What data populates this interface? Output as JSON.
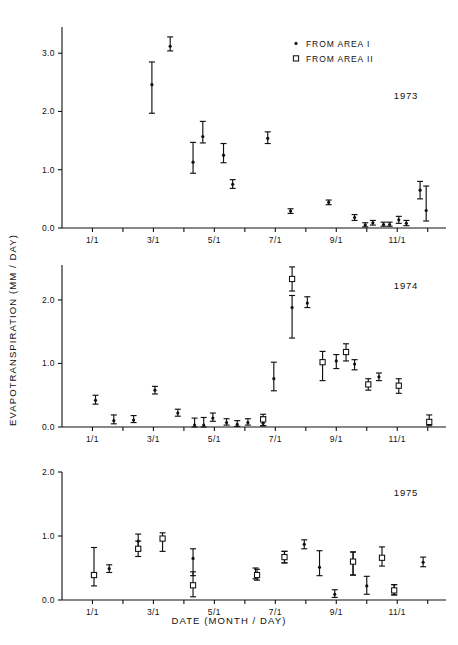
{
  "figure": {
    "xlabel": "DATE  (MONTH / DAY)",
    "ylabel": "EVAPOTRANSPIRATION  (MM / DAY)"
  },
  "legend": {
    "position": "top-right",
    "entries": [
      {
        "label": "FROM AREA I",
        "marker": "filled-dot"
      },
      {
        "label": "FROM AREA II",
        "marker": "open-square"
      }
    ]
  },
  "chart_data": [
    {
      "type": "scatter",
      "title": "1973",
      "xlabel": "DATE  (MONTH / DAY)",
      "ylabel": "EVAPOTRANSPIRATION  (MM / DAY)",
      "xlim": [
        0,
        12.6
      ],
      "ylim": [
        0.0,
        3.45
      ],
      "yticks": [
        0.0,
        1.0,
        2.0,
        3.0
      ],
      "ytick_labels": [
        "0.0",
        "1.0",
        "2.0",
        "3.0"
      ],
      "xticks": [
        1,
        2,
        3,
        4,
        5,
        6,
        7,
        8,
        9,
        10,
        11,
        12
      ],
      "xtick_labels": [
        "1/1",
        "",
        "3/1",
        "",
        "5/1",
        "",
        "7/1",
        "",
        "9/1",
        "",
        "11/1",
        ""
      ],
      "grid": false,
      "series": [
        {
          "name": "FROM AREA I",
          "marker": "filled-dot",
          "points": [
            {
              "x": 2.95,
              "y": 2.46,
              "low": 1.97,
              "high": 2.85
            },
            {
              "x": 3.55,
              "y": 3.12,
              "low": 3.04,
              "high": 3.28
            },
            {
              "x": 4.3,
              "y": 1.13,
              "low": 0.94,
              "high": 1.47
            },
            {
              "x": 4.62,
              "y": 1.57,
              "low": 1.46,
              "high": 1.83
            },
            {
              "x": 5.3,
              "y": 1.25,
              "low": 1.12,
              "high": 1.45
            },
            {
              "x": 5.6,
              "y": 0.75,
              "low": 0.68,
              "high": 0.83
            },
            {
              "x": 6.75,
              "y": 1.54,
              "low": 1.45,
              "high": 1.65
            },
            {
              "x": 7.5,
              "y": 0.29,
              "low": 0.25,
              "high": 0.33
            },
            {
              "x": 8.75,
              "y": 0.44,
              "low": 0.4,
              "high": 0.48
            },
            {
              "x": 9.6,
              "y": 0.18,
              "low": 0.13,
              "high": 0.23
            },
            {
              "x": 9.95,
              "y": 0.05,
              "low": 0.02,
              "high": 0.09
            },
            {
              "x": 10.2,
              "y": 0.09,
              "low": 0.05,
              "high": 0.13
            },
            {
              "x": 10.55,
              "y": 0.06,
              "low": 0.03,
              "high": 0.1
            },
            {
              "x": 10.75,
              "y": 0.06,
              "low": 0.03,
              "high": 0.1
            },
            {
              "x": 11.05,
              "y": 0.14,
              "low": 0.08,
              "high": 0.2
            },
            {
              "x": 11.3,
              "y": 0.08,
              "low": 0.04,
              "high": 0.13
            },
            {
              "x": 11.75,
              "y": 0.65,
              "low": 0.5,
              "high": 0.8
            },
            {
              "x": 11.95,
              "y": 0.3,
              "low": 0.12,
              "high": 0.72
            }
          ]
        }
      ]
    },
    {
      "type": "scatter",
      "title": "1974",
      "xlabel": "DATE  (MONTH / DAY)",
      "ylabel": "EVAPOTRANSPIRATION  (MM / DAY)",
      "xlim": [
        0,
        12.6
      ],
      "ylim": [
        0.0,
        2.55
      ],
      "yticks": [
        0.0,
        1.0,
        2.0
      ],
      "ytick_labels": [
        "0.0",
        "1.0",
        "2.0"
      ],
      "xticks": [
        1,
        2,
        3,
        4,
        5,
        6,
        7,
        8,
        9,
        10,
        11,
        12
      ],
      "xtick_labels": [
        "1/1",
        "",
        "3/1",
        "",
        "5/1",
        "",
        "7/1",
        "",
        "9/1",
        "",
        "11/1",
        ""
      ],
      "grid": false,
      "series": [
        {
          "name": "FROM AREA I",
          "marker": "filled-dot",
          "points": [
            {
              "x": 1.1,
              "y": 0.42,
              "low": 0.36,
              "high": 0.5
            },
            {
              "x": 1.7,
              "y": 0.1,
              "low": 0.05,
              "high": 0.19
            },
            {
              "x": 2.35,
              "y": 0.11,
              "low": 0.07,
              "high": 0.18
            },
            {
              "x": 3.05,
              "y": 0.58,
              "low": 0.52,
              "high": 0.64
            },
            {
              "x": 3.8,
              "y": 0.22,
              "low": 0.17,
              "high": 0.28
            },
            {
              "x": 4.35,
              "y": 0.03,
              "low": 0.0,
              "high": 0.14
            },
            {
              "x": 4.65,
              "y": 0.03,
              "low": 0.0,
              "high": 0.15
            },
            {
              "x": 4.95,
              "y": 0.14,
              "low": 0.09,
              "high": 0.22
            },
            {
              "x": 5.4,
              "y": 0.07,
              "low": 0.03,
              "high": 0.13
            },
            {
              "x": 5.75,
              "y": 0.04,
              "low": 0.01,
              "high": 0.1
            },
            {
              "x": 6.1,
              "y": 0.07,
              "low": 0.03,
              "high": 0.13
            },
            {
              "x": 6.6,
              "y": 0.06,
              "low": 0.02,
              "high": 0.16
            },
            {
              "x": 6.95,
              "y": 0.76,
              "low": 0.57,
              "high": 1.02
            },
            {
              "x": 7.55,
              "y": 1.88,
              "low": 1.4,
              "high": 2.07
            },
            {
              "x": 8.05,
              "y": 1.95,
              "low": 1.88,
              "high": 2.05
            },
            {
              "x": 9.0,
              "y": 1.04,
              "low": 0.92,
              "high": 1.14
            },
            {
              "x": 9.6,
              "y": 0.99,
              "low": 0.9,
              "high": 1.06
            },
            {
              "x": 10.4,
              "y": 0.79,
              "low": 0.73,
              "high": 0.85
            }
          ]
        },
        {
          "name": "FROM AREA II",
          "marker": "open-square",
          "points": [
            {
              "x": 6.6,
              "y": 0.12,
              "low": 0.02,
              "high": 0.2
            },
            {
              "x": 7.55,
              "y": 2.33,
              "low": 2.14,
              "high": 2.52
            },
            {
              "x": 8.55,
              "y": 1.02,
              "low": 0.73,
              "high": 1.19
            },
            {
              "x": 9.32,
              "y": 1.18,
              "low": 1.04,
              "high": 1.31
            },
            {
              "x": 10.05,
              "y": 0.67,
              "low": 0.58,
              "high": 0.76
            },
            {
              "x": 11.05,
              "y": 0.65,
              "low": 0.53,
              "high": 0.76
            },
            {
              "x": 12.05,
              "y": 0.08,
              "low": 0.02,
              "high": 0.19
            }
          ]
        }
      ]
    },
    {
      "type": "scatter",
      "title": "1975",
      "xlabel": "DATE  (MONTH / DAY)",
      "ylabel": "EVAPOTRANSPIRATION  (MM / DAY)",
      "xlim": [
        0,
        12.6
      ],
      "ylim": [
        0.0,
        2.0
      ],
      "yticks": [
        0.0,
        1.0,
        2.0
      ],
      "ytick_labels": [
        "0.0",
        "1.0",
        "2.0"
      ],
      "xticks": [
        1,
        2,
        3,
        4,
        5,
        6,
        7,
        8,
        9,
        10,
        11,
        12
      ],
      "xtick_labels": [
        "1/1",
        "",
        "3/1",
        "",
        "5/1",
        "",
        "7/1",
        "",
        "9/1",
        "",
        "11/1",
        ""
      ],
      "grid": false,
      "series": [
        {
          "name": "FROM AREA I",
          "marker": "filled-dot",
          "points": [
            {
              "x": 1.55,
              "y": 0.49,
              "low": 0.43,
              "high": 0.55
            },
            {
              "x": 2.5,
              "y": 0.92,
              "low": 0.78,
              "high": 1.03
            },
            {
              "x": 4.3,
              "y": 0.65,
              "low": 0.38,
              "high": 0.8
            },
            {
              "x": 6.35,
              "y": 0.41,
              "low": 0.33,
              "high": 0.5
            },
            {
              "x": 7.3,
              "y": 0.67,
              "low": 0.58,
              "high": 0.76
            },
            {
              "x": 7.95,
              "y": 0.87,
              "low": 0.8,
              "high": 0.94
            },
            {
              "x": 8.45,
              "y": 0.51,
              "low": 0.38,
              "high": 0.77
            },
            {
              "x": 8.95,
              "y": 0.09,
              "low": 0.04,
              "high": 0.16
            },
            {
              "x": 9.55,
              "y": 0.6,
              "low": 0.39,
              "high": 0.75
            },
            {
              "x": 10.0,
              "y": 0.22,
              "low": 0.09,
              "high": 0.37
            },
            {
              "x": 10.9,
              "y": 0.15,
              "low": 0.08,
              "high": 0.24
            },
            {
              "x": 11.85,
              "y": 0.59,
              "low": 0.52,
              "high": 0.67
            }
          ]
        },
        {
          "name": "FROM AREA II",
          "marker": "open-square",
          "points": [
            {
              "x": 1.05,
              "y": 0.39,
              "low": 0.22,
              "high": 0.82
            },
            {
              "x": 2.5,
              "y": 0.8,
              "low": 0.68,
              "high": 0.92
            },
            {
              "x": 3.3,
              "y": 0.96,
              "low": 0.76,
              "high": 1.05
            },
            {
              "x": 4.3,
              "y": 0.23,
              "low": 0.05,
              "high": 0.44
            },
            {
              "x": 6.4,
              "y": 0.39,
              "low": 0.31,
              "high": 0.48
            },
            {
              "x": 7.3,
              "y": 0.67,
              "low": 0.58,
              "high": 0.76
            },
            {
              "x": 9.55,
              "y": 0.6,
              "low": 0.39,
              "high": 0.75
            },
            {
              "x": 10.5,
              "y": 0.66,
              "low": 0.53,
              "high": 0.83
            },
            {
              "x": 10.9,
              "y": 0.15,
              "low": 0.08,
              "high": 0.24
            }
          ]
        }
      ]
    }
  ]
}
